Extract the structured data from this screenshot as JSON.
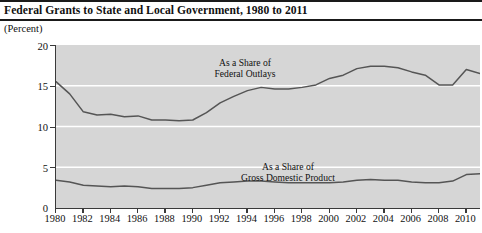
{
  "chart_data": {
    "type": "line",
    "title": "Federal Grants to State and Local Government, 1980 to 2011",
    "subtitle": "",
    "unit_label": "(Percent)",
    "xlabel": "",
    "ylabel": "",
    "xlim": [
      1980,
      2011
    ],
    "ylim": [
      0,
      20
    ],
    "yticks": [
      0,
      5,
      10,
      15,
      20
    ],
    "ytick_labels": [
      "0",
      "5",
      "10",
      "15",
      "20"
    ],
    "xticks": [
      1980,
      1982,
      1984,
      1986,
      1988,
      1990,
      1992,
      1994,
      1996,
      1998,
      2000,
      2002,
      2004,
      2006,
      2008,
      2010
    ],
    "xtick_labels": [
      "1980",
      "1982",
      "1984",
      "1986",
      "1988",
      "1990",
      "1992",
      "1994",
      "1996",
      "1998",
      "2000",
      "2002",
      "2004",
      "2006",
      "2008",
      "2010"
    ],
    "grid": "horizontal-white",
    "legend_position": "inline-annotation",
    "plot_background": "#d6d6d6",
    "line_color": "#555555",
    "x": [
      1980,
      1981,
      1982,
      1983,
      1984,
      1985,
      1986,
      1987,
      1988,
      1989,
      1990,
      1991,
      1992,
      1993,
      1994,
      1995,
      1996,
      1997,
      1998,
      1999,
      2000,
      2001,
      2002,
      2003,
      2004,
      2005,
      2006,
      2007,
      2008,
      2009,
      2010,
      2011
    ],
    "series": [
      {
        "name": "As a Share of Federal Outlays",
        "annotation_line1": "As a Share of",
        "annotation_line2": "Federal Outlays",
        "values": [
          15.5,
          14.0,
          11.8,
          11.4,
          11.5,
          11.2,
          11.3,
          10.8,
          10.8,
          10.7,
          10.8,
          11.7,
          12.9,
          13.7,
          14.4,
          14.8,
          14.6,
          14.6,
          14.8,
          15.1,
          15.9,
          16.3,
          17.1,
          17.4,
          17.4,
          17.2,
          16.7,
          16.3,
          15.1,
          15.1,
          17.0,
          16.5
        ]
      },
      {
        "name": "As a Share of Gross Domestic Product",
        "annotation_line1": "As a Share of",
        "annotation_line2": "Gross Domestic Product",
        "values": [
          3.4,
          3.2,
          2.8,
          2.7,
          2.6,
          2.7,
          2.6,
          2.4,
          2.4,
          2.4,
          2.5,
          2.8,
          3.1,
          3.2,
          3.3,
          3.3,
          3.2,
          3.1,
          3.1,
          3.1,
          3.1,
          3.2,
          3.4,
          3.5,
          3.4,
          3.4,
          3.2,
          3.1,
          3.1,
          3.3,
          4.1,
          4.2
        ]
      }
    ]
  }
}
